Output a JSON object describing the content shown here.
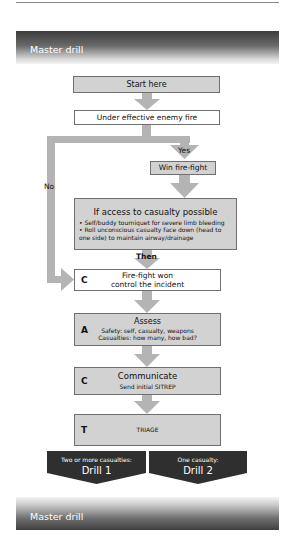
{
  "header": {
    "title": "Master drill"
  },
  "footer": {
    "title": "Master drill"
  },
  "flow": {
    "start": "Start here",
    "under_fire": "Under effective enemy fire",
    "yes_label": "Yes",
    "no_label": "No",
    "win_firefight": "Win fire-fight",
    "access": {
      "title": "If access to casualty possible",
      "bullets": [
        "• Self/buddy tourniquet for severe limb bleeding",
        "• Roll unconscious casualty face down (head to one side) to maintain airway/drainage"
      ]
    },
    "then_label": "Then",
    "control": {
      "letter": "C",
      "line1": "Fire-fight won",
      "line2": "control the incident"
    },
    "assess": {
      "letter": "A",
      "title": "Assess",
      "line1": "Safety: self, casualty, weapons",
      "line2": "Casualties: how many, how bad?"
    },
    "communicate": {
      "letter": "C",
      "title": "Communicate",
      "line1": "Send initial SITREP"
    },
    "triage": {
      "letter": "T",
      "title": "TRIAGE"
    },
    "drills": [
      {
        "caption": "Two or more casualties:",
        "name": "Drill 1"
      },
      {
        "caption": "One casualty:",
        "name": "Drill 2"
      }
    ]
  },
  "colors": {
    "box_grey": "#d2d2d2",
    "arrow_grey": "#b4b4b4",
    "drill_dark": "#2f2f2f",
    "border": "#6f6f6f"
  }
}
